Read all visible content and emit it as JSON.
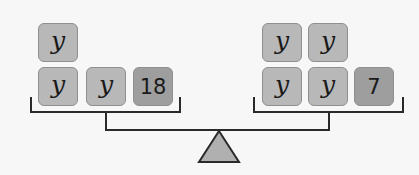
{
  "left_pan": {
    "top_row": [
      {
        "label": "y",
        "type": "variable"
      }
    ],
    "bottom_row": [
      {
        "label": "y",
        "type": "variable"
      },
      {
        "label": "y",
        "type": "variable"
      },
      {
        "label": "18",
        "type": "constant"
      }
    ]
  },
  "right_pan": {
    "top_row": [
      {
        "label": "y",
        "type": "variable"
      },
      {
        "label": "y",
        "type": "variable"
      }
    ],
    "bottom_row": [
      {
        "label": "y",
        "type": "variable"
      },
      {
        "label": "y",
        "type": "variable"
      },
      {
        "label": "7",
        "type": "constant"
      }
    ]
  },
  "colors": {
    "variable_block": "#b8b8b8",
    "constant_block": "#9e9e9e",
    "block_border": "#8f8f8f",
    "scale_line": "#2a2a2a",
    "fulcrum_fill": "#b0b0b0"
  }
}
